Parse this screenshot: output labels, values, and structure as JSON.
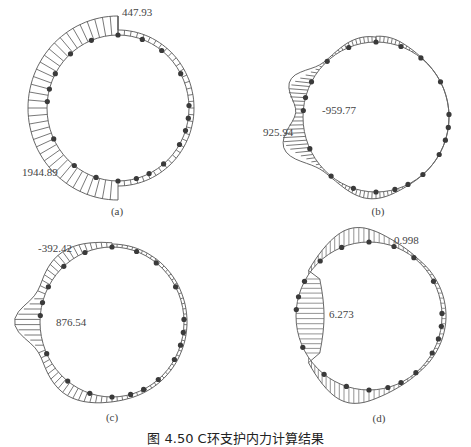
{
  "figure": {
    "caption": "图 4.50   C环支护内力计算结果",
    "panels": [
      {
        "id": "a",
        "label": "(a)",
        "annotations": [
          {
            "text": "447.93",
            "position": "top"
          },
          {
            "text": "1944.89",
            "position": "lower-left"
          }
        ]
      },
      {
        "id": "b",
        "label": "(b)",
        "annotations": [
          {
            "text": "-959.77",
            "position": "left-upper"
          },
          {
            "text": "925.94",
            "position": "left-lower"
          }
        ]
      },
      {
        "id": "c",
        "label": "(c)",
        "annotations": [
          {
            "text": "-392.42",
            "position": "upper-left"
          },
          {
            "text": "876.54",
            "position": "left"
          }
        ]
      },
      {
        "id": "d",
        "label": "(d)",
        "annotations": [
          {
            "text": "0.998",
            "position": "top-right"
          },
          {
            "text": "6.273",
            "position": "left"
          }
        ]
      }
    ]
  },
  "colors": {
    "ring": "#666666",
    "hatch": "#555555",
    "node": "#3a3a3a",
    "text": "#444444"
  }
}
